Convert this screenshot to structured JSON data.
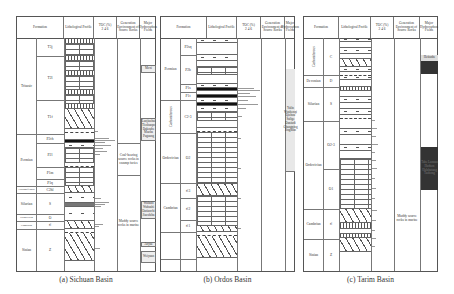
{
  "headers": {
    "formation": "Formation",
    "lithology": "Lithological Profile",
    "toc": "TOC (%)",
    "toc_ticks": "2  4  6",
    "environment": "Generation Environment of Source Rocks",
    "fields": "Major Hydrocarbon Fields"
  },
  "panels": [
    {
      "caption": "(a) Sichuan Basin",
      "systems": [
        {
          "name": "Triassic",
          "top": 21,
          "height": 122
        },
        {
          "name": "Permian",
          "top": 143,
          "height": 75
        },
        {
          "name": "Carboniferous",
          "top": 218,
          "height": 6
        },
        {
          "name": "Silurian",
          "top": 224,
          "height": 22
        },
        {
          "name": "Ordovician",
          "top": 246,
          "height": 6
        },
        {
          "name": "Cambrian",
          "top": 252,
          "height": 8
        },
        {
          "name": "Sinian",
          "top": 260,
          "height": 0
        }
      ],
      "formations": [
        "T3j",
        "T2l",
        "T1f",
        "P2ch",
        "P2l",
        "P1m",
        "P1q",
        "C2hl",
        "S",
        "O",
        "∈",
        "Z"
      ],
      "environments": [
        {
          "text": "Coal-bearing source rocks in swamp facies"
        },
        {
          "text": "Muddy source rocks in marine"
        }
      ],
      "fields": [
        {
          "text": "Moxi"
        },
        {
          "text": "Luojiazhai Tieshanpo Dukouhe Maoba Puguang"
        },
        {
          "text": "Wubaiti Wuhashi Datianchi Jiaoshiba"
        },
        {
          "text": "Anyue"
        },
        {
          "text": "Weiyuan"
        }
      ]
    },
    {
      "caption": "(b) Ordos Basin",
      "systems": [
        {
          "name": "Permian"
        },
        {
          "name": "Carboniferous"
        },
        {
          "name": "Ordovician"
        },
        {
          "name": "Cambrian"
        }
      ],
      "formations": [
        "P2sq",
        "P2h",
        "P1s",
        "P1t",
        "C2-3",
        "O2",
        "∈3",
        "∈2",
        "∈1"
      ],
      "fields": [
        {
          "text": "Yulin Wushenqi Qizhou Sulige Daniudi Changqing Jingbian"
        }
      ]
    },
    {
      "caption": "(c) Tarim Basin",
      "systems": [
        {
          "name": "Carboniferous"
        },
        {
          "name": "Devonian"
        },
        {
          "name": "Silurian"
        },
        {
          "name": "Ordovician"
        },
        {
          "name": "Cambrian"
        },
        {
          "name": "Sinian"
        }
      ],
      "formations": [
        "C",
        "D",
        "S",
        "O2-3",
        "O1",
        "∈",
        "Z"
      ],
      "environments": [
        {
          "text": "Muddy source rocks in marine"
        }
      ],
      "fields": [
        {
          "text": "Hetianhe"
        },
        {
          "text": "Tahe Lunnan Hudson Halahatang Tazhong"
        }
      ]
    }
  ]
}
